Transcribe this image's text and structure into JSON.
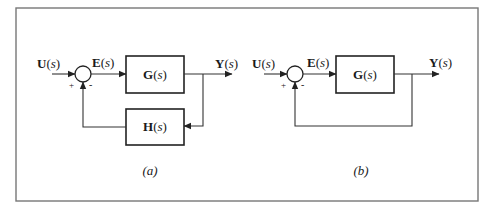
{
  "figure": {
    "frame_color": "#777777",
    "line_color": "#333333"
  },
  "diagram_a": {
    "caption": "(a)",
    "input_label": {
      "var": "U",
      "arg": "s"
    },
    "error_label": {
      "var": "E",
      "arg": "s"
    },
    "output_label": {
      "var": "Y",
      "arg": "s"
    },
    "forward_block": {
      "var": "G",
      "arg": "s"
    },
    "feedback_block": {
      "var": "H",
      "arg": "s"
    },
    "summer_signs": {
      "plus": "+",
      "minus": "-"
    }
  },
  "diagram_b": {
    "caption": "(b)",
    "input_label": {
      "var": "U",
      "arg": "s"
    },
    "error_label": {
      "var": "E",
      "arg": "s"
    },
    "output_label": {
      "var": "Y",
      "arg": "s"
    },
    "forward_block": {
      "var": "G",
      "arg": "s"
    },
    "summer_signs": {
      "plus": "+",
      "minus": "-"
    }
  },
  "paren_open": "(",
  "paren_close": ")"
}
